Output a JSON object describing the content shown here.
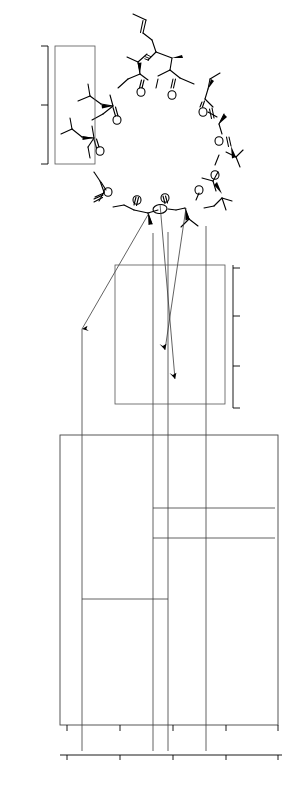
{
  "figure": {
    "panels": [
      {
        "id": "a",
        "label": "(a)",
        "kind": "1D proton spectrum"
      },
      {
        "id": "b",
        "label": "(b)",
        "kind": "2D correlation spectrum"
      },
      {
        "id": "c",
        "label": "(c)",
        "kind": "2D carbonyl region"
      },
      {
        "id": "d",
        "label": "(d)",
        "kind": "2D aliphatic carbon region"
      }
    ]
  },
  "structure": {
    "name": "cyclosporin-a",
    "residue_numbers": [
      "1",
      "2",
      "3",
      "4",
      "5",
      "6",
      "7",
      "8",
      "9",
      "10",
      "11"
    ],
    "atom_labels": [
      {
        "text": "OH",
        "x": 186,
        "y": 60
      },
      {
        "text": "Me",
        "x": 150,
        "y": 71
      },
      {
        "text": "N",
        "x": 152,
        "y": 79
      },
      {
        "text": "NH",
        "x": 196,
        "y": 84
      },
      {
        "text": "MeN",
        "x": 105,
        "y": 90
      },
      {
        "text": "O",
        "x": 141,
        "y": 89
      },
      {
        "text": "O",
        "x": 172,
        "y": 92
      },
      {
        "text": "NMe",
        "x": 225,
        "y": 113
      },
      {
        "text": "O",
        "x": 114,
        "y": 111
      },
      {
        "text": "O",
        "x": 202,
        "y": 110
      },
      {
        "text": "MeN",
        "x": 84,
        "y": 126
      },
      {
        "text": "NMe",
        "x": 233,
        "y": 152
      },
      {
        "text": "O",
        "x": 218,
        "y": 139
      },
      {
        "text": "O",
        "x": 100,
        "y": 142
      },
      {
        "text": "MeN",
        "x": 82,
        "y": 171
      },
      {
        "text": "O",
        "x": 215,
        "y": 172
      },
      {
        "text": "NH",
        "x": 221,
        "y": 191
      },
      {
        "text": "O",
        "x": 110,
        "y": 187
      },
      {
        "text": "HN",
        "x": 102,
        "y": 206
      },
      {
        "text": "O",
        "x": 138,
        "y": 201
      },
      {
        "text": "O",
        "x": 165,
        "y": 203
      },
      {
        "text": "NMe",
        "x": 196,
        "y": 208
      },
      {
        "text": "O",
        "x": 198,
        "y": 193
      }
    ]
  },
  "chart_data": [
    {
      "id": "a",
      "type": "line",
      "label": "(a)",
      "xlabel": "δ (ppm)",
      "ylabel": "",
      "xlim": [
        8.8,
        -0.4
      ],
      "xticks": [
        8,
        6,
        4,
        2,
        0
      ],
      "xticklabels": [
        "8",
        "6",
        "4",
        "2",
        "0"
      ],
      "grid": false,
      "description": "1H NMR spectrum of cyclosporin A",
      "peaks": [
        {
          "x": 8.05,
          "h": 0.06
        },
        {
          "x": 7.78,
          "h": 0.08
        },
        {
          "x": 7.56,
          "h": 0.05
        },
        {
          "x": 7.3,
          "h": 0.07
        },
        {
          "x": 5.7,
          "h": 0.04
        },
        {
          "x": 5.42,
          "h": 0.03
        },
        {
          "x": 5.18,
          "h": 0.11
        },
        {
          "x": 5.02,
          "h": 0.15
        },
        {
          "x": 4.92,
          "h": 0.1
        },
        {
          "x": 4.82,
          "h": 0.13
        },
        {
          "x": 4.7,
          "h": 0.09
        },
        {
          "x": 4.6,
          "h": 0.12
        },
        {
          "x": 4.5,
          "h": 0.08
        },
        {
          "x": 4.4,
          "h": 0.1
        },
        {
          "x": 4.3,
          "h": 0.07
        },
        {
          "x": 3.95,
          "h": 0.04
        },
        {
          "x": 3.52,
          "h": 0.06
        },
        {
          "x": 3.35,
          "h": 0.68
        },
        {
          "x": 3.22,
          "h": 0.3
        },
        {
          "x": 3.1,
          "h": 0.62
        },
        {
          "x": 3.0,
          "h": 0.58
        },
        {
          "x": 2.7,
          "h": 0.55
        },
        {
          "x": 2.58,
          "h": 0.25
        },
        {
          "x": 2.4,
          "h": 0.1
        },
        {
          "x": 2.1,
          "h": 0.07
        },
        {
          "x": 1.9,
          "h": 0.05
        },
        {
          "x": 1.68,
          "h": 0.06
        },
        {
          "x": 1.45,
          "h": 0.08
        },
        {
          "x": 1.25,
          "h": 0.34
        },
        {
          "x": 1.1,
          "h": 0.12
        },
        {
          "x": 0.98,
          "h": 0.3
        },
        {
          "x": 0.9,
          "h": 0.4
        },
        {
          "x": 0.82,
          "h": 0.52
        },
        {
          "x": 0.74,
          "h": 0.66
        },
        {
          "x": 0.66,
          "h": 0.9
        },
        {
          "x": 0.58,
          "h": 0.78
        },
        {
          "x": 0.48,
          "h": 0.55
        },
        {
          "x": 0.38,
          "h": 0.22
        }
      ]
    },
    {
      "id": "b",
      "type": "scatter",
      "label": "(b)",
      "xlabel": "δ (ppm)",
      "ylabel": "",
      "xlim": [
        8.8,
        -0.4
      ],
      "grid": false,
      "description": "2D correlation contour map, open ellipse cross peaks",
      "points": [
        {
          "x": 0.62,
          "y": 0.06,
          "r": 3.6
        },
        {
          "x": 0.72,
          "y": 0.09,
          "r": 3.0
        },
        {
          "x": 0.85,
          "y": 0.07,
          "r": 2.6
        },
        {
          "x": 0.95,
          "y": 0.075,
          "r": 2.3
        },
        {
          "x": 1.05,
          "y": 0.065,
          "r": 2.3
        },
        {
          "x": 1.15,
          "y": 0.06,
          "r": 2.4
        },
        {
          "x": 1.28,
          "y": 0.075,
          "r": 2.3
        },
        {
          "x": 1.4,
          "y": 0.07,
          "r": 2.2
        },
        {
          "x": 1.52,
          "y": 0.075,
          "r": 2.2
        },
        {
          "x": 1.72,
          "y": 0.07,
          "r": 2.0
        },
        {
          "x": 2.05,
          "y": 0.075,
          "r": 2.0
        },
        {
          "x": 0.55,
          "y": 0.13,
          "r": 3.2
        },
        {
          "x": 0.6,
          "y": 0.16,
          "r": 2.6
        },
        {
          "x": 0.7,
          "y": 0.155,
          "r": 2.5
        },
        {
          "x": 0.58,
          "y": 0.2,
          "r": 2.6
        },
        {
          "x": 0.52,
          "y": 0.25,
          "r": 2.4
        },
        {
          "x": 0.95,
          "y": 0.17,
          "r": 4.2
        },
        {
          "x": 1.35,
          "y": 0.145,
          "r": 2.2
        },
        {
          "x": 1.6,
          "y": 0.15,
          "r": 2.2
        },
        {
          "x": 1.1,
          "y": 0.22,
          "r": 2.2
        },
        {
          "x": 1.5,
          "y": 0.235,
          "r": 2.2
        },
        {
          "x": 1.25,
          "y": 0.3,
          "r": 4.0
        },
        {
          "x": 1.55,
          "y": 0.345,
          "r": 2.8
        },
        {
          "x": 1.62,
          "y": 0.36,
          "r": 2.8
        },
        {
          "x": 1.72,
          "y": 0.375,
          "r": 2.8
        },
        {
          "x": 1.42,
          "y": 0.4,
          "r": 4.2
        },
        {
          "x": 2.05,
          "y": 0.43,
          "r": 2.2
        },
        {
          "x": 2.55,
          "y": 0.145,
          "r": 2.0
        },
        {
          "x": 2.95,
          "y": 0.12,
          "r": 2.2
        },
        {
          "x": 3.25,
          "y": 0.135,
          "r": 2.2
        },
        {
          "x": 3.3,
          "y": 0.175,
          "r": 2.2
        },
        {
          "x": 3.35,
          "y": 0.225,
          "r": 2.0
        },
        {
          "x": 3.85,
          "y": 0.145,
          "r": 2.0
        },
        {
          "x": 3.95,
          "y": 0.185,
          "r": 2.2
        },
        {
          "x": 4.25,
          "y": 0.115,
          "r": 2.2
        },
        {
          "x": 4.35,
          "y": 0.155,
          "r": 2.2
        },
        {
          "x": 4.55,
          "y": 0.12,
          "r": 2.2
        },
        {
          "x": 4.6,
          "y": 0.175,
          "r": 2.2
        },
        {
          "x": 4.95,
          "y": 0.12,
          "r": 2.2
        },
        {
          "x": 5.05,
          "y": 0.125,
          "r": 2.2
        },
        {
          "x": 5.0,
          "y": 0.3,
          "r": 2.4
        },
        {
          "x": 5.05,
          "y": 0.4,
          "r": 2.4
        },
        {
          "x": 5.6,
          "y": 0.125,
          "r": 2.2
        },
        {
          "x": 5.65,
          "y": 0.175,
          "r": 2.2
        },
        {
          "x": 6.4,
          "y": 0.115,
          "r": 2.2
        },
        {
          "x": 6.35,
          "y": 0.175,
          "r": 2.2
        },
        {
          "x": 6.1,
          "y": 0.355,
          "r": 2.2
        },
        {
          "x": 4.85,
          "y": 0.49,
          "r": 2.2
        },
        {
          "x": 3.4,
          "y": 0.48,
          "r": 2.2
        },
        {
          "x": 2.2,
          "y": 0.475,
          "r": 2.2
        },
        {
          "x": 1.45,
          "y": 0.56,
          "r": 2.4
        },
        {
          "x": 1.3,
          "y": 0.595,
          "r": 2.6
        },
        {
          "x": 1.05,
          "y": 0.6,
          "r": 2.4
        },
        {
          "x": 1.18,
          "y": 0.625,
          "r": 2.4
        },
        {
          "x": 0.98,
          "y": 0.64,
          "r": 2.4
        },
        {
          "x": 2.05,
          "y": 0.62,
          "r": 2.2
        },
        {
          "x": 1.95,
          "y": 0.66,
          "r": 2.2
        },
        {
          "x": 2.25,
          "y": 0.655,
          "r": 2.6
        },
        {
          "x": 1.8,
          "y": 0.695,
          "r": 2.2
        },
        {
          "x": 1.6,
          "y": 0.7,
          "r": 2.6
        },
        {
          "x": 2.3,
          "y": 0.72,
          "r": 2.2
        },
        {
          "x": 1.05,
          "y": 0.745,
          "r": 2.2
        },
        {
          "x": 0.75,
          "y": 0.745,
          "r": 2.2
        },
        {
          "x": 1.35,
          "y": 0.78,
          "r": 2.2
        },
        {
          "x": 4.55,
          "y": 0.565,
          "r": 2.4
        },
        {
          "x": 4.3,
          "y": 0.58,
          "r": 2.2
        },
        {
          "x": 4.65,
          "y": 0.63,
          "r": 2.4
        },
        {
          "x": 4.72,
          "y": 0.66,
          "r": 2.4
        },
        {
          "x": 4.8,
          "y": 0.7,
          "r": 2.4
        },
        {
          "x": 4.9,
          "y": 0.735,
          "r": 2.4
        },
        {
          "x": 5.0,
          "y": 0.76,
          "r": 2.4
        },
        {
          "x": 5.2,
          "y": 0.79,
          "r": 2.4
        },
        {
          "x": 5.35,
          "y": 0.82,
          "r": 2.4
        },
        {
          "x": 6.7,
          "y": 0.565,
          "r": 2.6
        },
        {
          "x": 7.3,
          "y": 0.6,
          "r": 2.2
        },
        {
          "x": 7.55,
          "y": 0.835,
          "r": 2.2
        },
        {
          "x": 7.3,
          "y": 0.865,
          "r": 2.4
        },
        {
          "x": 6.95,
          "y": 0.9,
          "r": 2.4
        },
        {
          "x": 7.78,
          "y": 0.93,
          "r": 2.8
        },
        {
          "x": 8.05,
          "y": 0.955,
          "r": 2.2
        },
        {
          "x": 5.02,
          "y": 0.89,
          "r": 2.4
        },
        {
          "x": 4.82,
          "y": 0.92,
          "r": 2.2
        },
        {
          "x": 4.45,
          "y": 0.905,
          "r": 2.4
        },
        {
          "x": 4.4,
          "y": 0.945,
          "r": 2.2
        }
      ]
    },
    {
      "id": "c",
      "type": "scatter",
      "label": "(c)",
      "ylabel": "δ (ppm)",
      "ylim": [
        245,
        265
      ],
      "yticks": [
        245,
        255,
        265
      ],
      "yticklabels": [
        "245",
        "255",
        "265"
      ],
      "grid": false,
      "description": "carbonyl carbon region cross peaks",
      "points": [
        {
          "x": 0.3,
          "y": 248.0,
          "w": 9,
          "h": 3
        },
        {
          "x": 0.22,
          "y": 250.2,
          "w": 8,
          "h": 3
        },
        {
          "x": 0.48,
          "y": 250.9,
          "w": 8,
          "h": 3
        },
        {
          "x": 0.58,
          "y": 259.8,
          "w": 8,
          "h": 3
        }
      ]
    },
    {
      "id": "d",
      "type": "scatter",
      "label": "(d)",
      "ylabel": "δ (ppm)",
      "ylim": [
        27,
        61
      ],
      "yticks": [
        30,
        40,
        50,
        60
      ],
      "yticklabels": [
        "30",
        "40",
        "50",
        "60"
      ],
      "grid": false,
      "description": "aliphatic carbon region cross peaks",
      "points": [
        {
          "x": 0.835,
          "y": 29.0,
          "w": 9,
          "h": 3
        },
        {
          "x": 0.935,
          "y": 28.9,
          "w": 10,
          "h": 3
        },
        {
          "x": 0.83,
          "y": 30.1,
          "w": 9,
          "h": 4
        },
        {
          "x": 0.855,
          "y": 31.2,
          "w": 8,
          "h": 3
        },
        {
          "x": 0.76,
          "y": 33.2,
          "w": 8,
          "h": 3
        },
        {
          "x": 0.785,
          "y": 40.0,
          "w": 9,
          "h": 3
        },
        {
          "x": 0.425,
          "y": 45.0,
          "w": 8,
          "h": 3
        },
        {
          "x": 0.235,
          "y": 47.2,
          "w": 8,
          "h": 3
        },
        {
          "x": 0.395,
          "y": 48.3,
          "w": 9,
          "h": 3
        },
        {
          "x": 0.45,
          "y": 48.6,
          "w": 9,
          "h": 4
        },
        {
          "x": 0.425,
          "y": 50.0,
          "w": 8,
          "h": 3
        },
        {
          "x": 0.145,
          "y": 51.5,
          "w": 8,
          "h": 3
        },
        {
          "x": 0.3,
          "y": 52.2,
          "w": 8,
          "h": 3
        },
        {
          "x": 0.405,
          "y": 52.4,
          "w": 9,
          "h": 3
        },
        {
          "x": 0.395,
          "y": 55.6,
          "w": 8,
          "h": 4
        },
        {
          "x": 0.46,
          "y": 55.4,
          "w": 8,
          "h": 3
        },
        {
          "x": 0.255,
          "y": 56.8,
          "w": 8,
          "h": 3
        },
        {
          "x": 0.185,
          "y": 58.2,
          "w": 8,
          "h": 3
        },
        {
          "x": 0.31,
          "y": 58.5,
          "w": 9,
          "h": 4
        },
        {
          "x": 0.155,
          "y": 59.9,
          "w": 9,
          "h": 3
        }
      ]
    }
  ],
  "axes": {
    "left_axis_title": "δ (ppm)",
    "right_axis_title": "δ (ppm)",
    "bottom_axis_title": "δ (ppm)"
  },
  "colors": {
    "ink": "#000000",
    "plot_line": "#4d4d4d",
    "peak_stroke": "#333333"
  }
}
